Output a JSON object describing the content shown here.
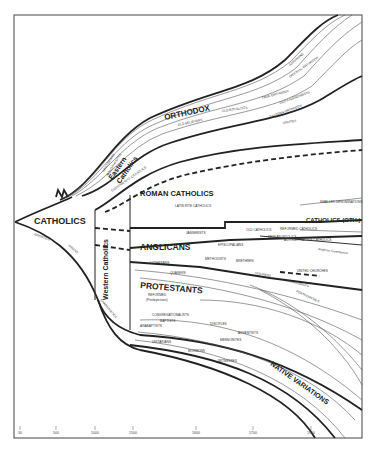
{
  "diagram": {
    "main_branches": {
      "catholics": "CATHOLICS",
      "orthodox": "ORTHODOX",
      "eastern_catholics": [
        "Eastern",
        "Catholics"
      ],
      "western_catholics": "Western Catholics",
      "roman_catholics": "ROMAN CATHOLICS",
      "anglicans": "ANGLICANS",
      "protestants": "PROTESTANTS",
      "native_variations": "NATIVE VARIATIONS",
      "catholics_other": "CATHOLICS (OTH.)"
    },
    "minor_labels": {
      "gnostics": "GNOSTICS",
      "arians": "ARIANS",
      "nestorians": "NESTORIANS",
      "monophysites": "MONOPHYSITES",
      "old_believers": "OLD BELIEVERS",
      "old_ritualists": "OLD RITUALISTS",
      "true_orthodox": "TRUE ORTHODOX",
      "old_calendarists": "OLD CALENDARISTS",
      "eastern_orthodox": "EASTERN ORTHODOX",
      "oriental_orthodox": "ORIENTAL ORTHODOX",
      "assyrians": "ASSYRIANS",
      "uniates": "UNIATES",
      "eastern_rite": "EASTERN RITE CATHOLICS",
      "latin_rite": "LATIN-RITE CATHOLICS",
      "jansenists": "JANSENISTS",
      "old_catholics": "OLD CATHOLICS",
      "reformed_catholics": "REFORMED CATHOLICS",
      "new_apostolics": "NEW APOSTOLICS",
      "autocephalous": "AUTOCEPHALOUS CATHOLICS",
      "episcopalians": "EPISCOPALIANS",
      "lutherans": "LUTHERANS",
      "quakers": "QUAKERS",
      "methodists": "METHODISTS",
      "brethren": "BRETHREN",
      "united_churches": "UNITED CHURCHES",
      "holiness": "HOLINESS",
      "salvationists": "SALVATIONISTS",
      "pentecostals": "PENTECOSTALS",
      "reformed": "REFORMED",
      "presbyterians": "(Presbyterians)",
      "congregationalists": "CONGREGATIONALISTS",
      "baptists": "BAPTISTS",
      "disciples": "DISCIPLES",
      "adventists": "ADVENTISTS",
      "anabaptists": "ANABAPTISTS",
      "mennonites": "MENNONITES",
      "unitarians": "UNITARIANS",
      "mormons": "MORMONS",
      "witnesses": "WITNESSES",
      "charismatics": "CHARISMATICS",
      "anglican_communion": "Anglican Communion",
      "smaller_groups": "SMALLER DENOMINATIONS"
    },
    "axis": {
      "ticks": [
        {
          "label": "30",
          "x": 20
        },
        {
          "label": "500",
          "x": 56
        },
        {
          "label": "1000",
          "x": 95
        },
        {
          "label": "1500",
          "x": 133
        },
        {
          "label": "1600",
          "x": 196
        },
        {
          "label": "1700",
          "x": 253
        },
        {
          "label": "1900",
          "x": 311
        }
      ]
    },
    "colors": {
      "line": "#222222",
      "background": "#ffffff"
    }
  }
}
